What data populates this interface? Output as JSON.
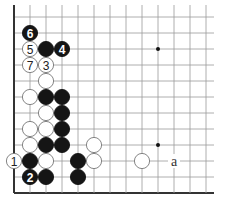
{
  "diagram": {
    "grid": {
      "cols": 13,
      "rows": 12,
      "origin_x": 14,
      "origin_y": 17,
      "spacing": 16,
      "right_x": 214
    },
    "star_points": [
      [
        9,
        2
      ],
      [
        9,
        8
      ]
    ],
    "stones": [
      {
        "c": 1,
        "r": 1,
        "color": "black",
        "label": "6"
      },
      {
        "c": 1,
        "r": 2,
        "color": "white",
        "label": "5"
      },
      {
        "c": 2,
        "r": 2,
        "color": "black",
        "label": ""
      },
      {
        "c": 3,
        "r": 2,
        "color": "black",
        "label": "4"
      },
      {
        "c": 1,
        "r": 3,
        "color": "white",
        "label": "7"
      },
      {
        "c": 2,
        "r": 3,
        "color": "white",
        "label": "3"
      },
      {
        "c": 2,
        "r": 4,
        "color": "white",
        "label": ""
      },
      {
        "c": 1,
        "r": 5,
        "color": "white",
        "label": ""
      },
      {
        "c": 2,
        "r": 5,
        "color": "black",
        "label": ""
      },
      {
        "c": 3,
        "r": 5,
        "color": "black",
        "label": ""
      },
      {
        "c": 2,
        "r": 6,
        "color": "white",
        "label": ""
      },
      {
        "c": 3,
        "r": 6,
        "color": "black",
        "label": ""
      },
      {
        "c": 1,
        "r": 7,
        "color": "white",
        "label": ""
      },
      {
        "c": 2,
        "r": 7,
        "color": "white",
        "label": ""
      },
      {
        "c": 3,
        "r": 7,
        "color": "black",
        "label": ""
      },
      {
        "c": 1,
        "r": 8,
        "color": "white",
        "label": ""
      },
      {
        "c": 2,
        "r": 8,
        "color": "black",
        "label": ""
      },
      {
        "c": 3,
        "r": 8,
        "color": "black",
        "label": ""
      },
      {
        "c": 5,
        "r": 8,
        "color": "white",
        "label": ""
      },
      {
        "c": 0,
        "r": 9,
        "color": "white",
        "label": "1"
      },
      {
        "c": 1,
        "r": 9,
        "color": "black",
        "label": ""
      },
      {
        "c": 2,
        "r": 9,
        "color": "white",
        "label": ""
      },
      {
        "c": 4,
        "r": 9,
        "color": "black",
        "label": ""
      },
      {
        "c": 5,
        "r": 9,
        "color": "white",
        "label": ""
      },
      {
        "c": 8,
        "r": 9,
        "color": "white",
        "label": ""
      },
      {
        "c": 1,
        "r": 10,
        "color": "black",
        "label": "2"
      },
      {
        "c": 2,
        "r": 10,
        "color": "black",
        "label": ""
      },
      {
        "c": 4,
        "r": 10,
        "color": "black",
        "label": ""
      }
    ],
    "markers": [
      {
        "c": 10,
        "r": 9,
        "label": "a"
      }
    ]
  }
}
